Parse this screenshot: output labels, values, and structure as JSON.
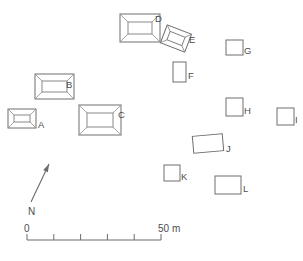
{
  "figure": {
    "kind": "archaeological-site-plan",
    "width": 303,
    "height": 261,
    "background_color": "#ffffff",
    "line_color": "#6e6e70",
    "label_color": "#4d4d4f"
  },
  "structures": [
    {
      "label": "A",
      "type": "stepped-platform",
      "x": 8,
      "y": 109,
      "w": 28,
      "h": 19,
      "rotation": 0,
      "inset": 6,
      "label_x": 38,
      "label_y": 128
    },
    {
      "label": "B",
      "type": "stepped-platform",
      "x": 35,
      "y": 74,
      "w": 39,
      "h": 25,
      "rotation": 0,
      "inset": 7,
      "label_x": 66,
      "label_y": 88
    },
    {
      "label": "C",
      "type": "stepped-platform",
      "x": 79,
      "y": 105,
      "w": 42,
      "h": 30,
      "rotation": 0,
      "inset": 8,
      "label_x": 118,
      "label_y": 118
    },
    {
      "label": "D",
      "type": "stepped-platform",
      "x": 120,
      "y": 14,
      "w": 40,
      "h": 28,
      "rotation": 0,
      "inset": 8,
      "label_x": 155,
      "label_y": 22
    },
    {
      "label": "E",
      "type": "stepped-platform",
      "x": 163,
      "y": 29,
      "w": 26,
      "h": 19,
      "rotation": 21,
      "inset": 5,
      "label_x": 189,
      "label_y": 43
    },
    {
      "label": "F",
      "type": "rectangle",
      "x": 173,
      "y": 62,
      "w": 13,
      "h": 20,
      "rotation": 0,
      "label_x": 188,
      "label_y": 79
    },
    {
      "label": "G",
      "type": "rectangle",
      "x": 226,
      "y": 40,
      "w": 17,
      "h": 15,
      "rotation": 0,
      "label_x": 244,
      "label_y": 54
    },
    {
      "label": "H",
      "type": "rectangle",
      "x": 226,
      "y": 98,
      "w": 17,
      "h": 18,
      "rotation": 0,
      "label_x": 244,
      "label_y": 114
    },
    {
      "label": "I",
      "type": "rectangle",
      "x": 277,
      "y": 108,
      "w": 17,
      "h": 17,
      "rotation": 0,
      "label_x": 295,
      "label_y": 123
    },
    {
      "label": "J",
      "type": "rectangle",
      "x": 193,
      "y": 135,
      "w": 30,
      "h": 17,
      "rotation": -5,
      "label_x": 226,
      "label_y": 152
    },
    {
      "label": "K",
      "type": "rectangle",
      "x": 164,
      "y": 165,
      "w": 16,
      "h": 16,
      "rotation": 0,
      "label_x": 181,
      "label_y": 180
    },
    {
      "label": "L",
      "type": "rectangle",
      "x": 215,
      "y": 176,
      "w": 26,
      "h": 18,
      "rotation": 0,
      "label_x": 243,
      "label_y": 192
    }
  ],
  "north_arrow": {
    "label": "N",
    "tail_x": 31,
    "tail_y": 202,
    "tip_x": 49,
    "tip_y": 164,
    "label_x": 28,
    "label_y": 215
  },
  "scale_bar": {
    "min_label": "0",
    "max_label": "50 m",
    "x_start": 27,
    "x_end": 161,
    "y": 240,
    "divisions": 5,
    "tick_height": 6,
    "min_label_x": 24,
    "min_label_y": 232,
    "max_label_x": 158,
    "max_label_y": 232,
    "units": "m",
    "max_value": 50
  }
}
